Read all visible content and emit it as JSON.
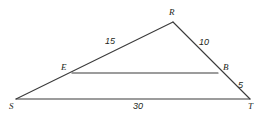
{
  "figure": {
    "type": "geometry-diagram",
    "background_color": "#ffffff",
    "stroke_color": "#3b3b3b",
    "text_color": "#231f20",
    "width": 266,
    "height": 117,
    "vertices": [
      {
        "id": "R",
        "label": "R",
        "x": 173,
        "y": 22,
        "label_x": 169,
        "label_y": 8
      },
      {
        "id": "E",
        "label": "E",
        "x": 72,
        "y": 73,
        "label_x": 61,
        "label_y": 63
      },
      {
        "id": "B",
        "label": "B",
        "x": 218,
        "y": 73,
        "label_x": 223,
        "label_y": 63
      },
      {
        "id": "S",
        "label": "S",
        "x": 16,
        "y": 99,
        "label_x": 9,
        "label_y": 102
      },
      {
        "id": "T",
        "label": "T",
        "x": 250,
        "y": 99,
        "label_x": 248,
        "label_y": 102
      }
    ],
    "segments": [
      {
        "id": "SR",
        "from": "S",
        "to": "R",
        "x1": 16,
        "y1": 99,
        "x2": 173,
        "y2": 22
      },
      {
        "id": "RT",
        "from": "R",
        "to": "T",
        "x1": 173,
        "y1": 22,
        "x2": 250,
        "y2": 99
      },
      {
        "id": "ST",
        "from": "S",
        "to": "T",
        "x1": 16,
        "y1": 99,
        "x2": 250,
        "y2": 99
      },
      {
        "id": "EB",
        "from": "E",
        "to": "B",
        "x1": 72,
        "y1": 73,
        "x2": 218,
        "y2": 73
      }
    ],
    "measures": [
      {
        "id": "RE",
        "value": "15",
        "on_segment": "SR",
        "x": 105,
        "y": 37
      },
      {
        "id": "RB",
        "value": "10",
        "on_segment": "RT",
        "x": 199,
        "y": 38
      },
      {
        "id": "BT",
        "value": "5",
        "on_segment": "RT",
        "x": 238,
        "y": 81
      },
      {
        "id": "ST",
        "value": "30",
        "on_segment": "ST",
        "x": 133,
        "y": 102
      }
    ]
  }
}
